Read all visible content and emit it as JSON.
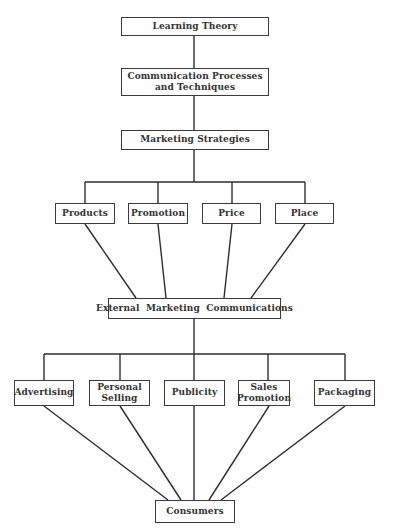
{
  "diagram": {
    "type": "hierarchy",
    "line_color": "#2e2e2e",
    "nodes": {
      "learning_theory": "Learning Theory",
      "communication_l1": "Communication Processes",
      "communication_l2": "and Techniques",
      "marketing_strategies": "Marketing Strategies",
      "products": "Products",
      "promotion": "Promotion",
      "price": "Price",
      "place": "Place",
      "external": "External  Marketing  Communications",
      "advertising": "Advertising",
      "personal_l1": "Personal",
      "personal_l2": "Selling",
      "publicity": "Publicity",
      "sales_l1": "Sales",
      "sales_l2": "Promotion",
      "packaging": "Packaging",
      "consumers": "Consumers"
    },
    "edges": [
      [
        "Learning Theory",
        "Communication Processes and Techniques"
      ],
      [
        "Communication Processes and Techniques",
        "Marketing Strategies"
      ],
      [
        "Marketing Strategies",
        "Products"
      ],
      [
        "Marketing Strategies",
        "Promotion"
      ],
      [
        "Marketing Strategies",
        "Price"
      ],
      [
        "Marketing Strategies",
        "Place"
      ],
      [
        "Products",
        "External Marketing Communications"
      ],
      [
        "Promotion",
        "External Marketing Communications"
      ],
      [
        "Price",
        "External Marketing Communications"
      ],
      [
        "Place",
        "External Marketing Communications"
      ],
      [
        "External Marketing Communications",
        "Advertising"
      ],
      [
        "External Marketing Communications",
        "Personal Selling"
      ],
      [
        "External Marketing Communications",
        "Publicity"
      ],
      [
        "External Marketing Communications",
        "Sales Promotion"
      ],
      [
        "External Marketing Communications",
        "Packaging"
      ],
      [
        "Advertising",
        "Consumers"
      ],
      [
        "Personal Selling",
        "Consumers"
      ],
      [
        "Publicity",
        "Consumers"
      ],
      [
        "Sales Promotion",
        "Consumers"
      ],
      [
        "Packaging",
        "Consumers"
      ]
    ]
  }
}
